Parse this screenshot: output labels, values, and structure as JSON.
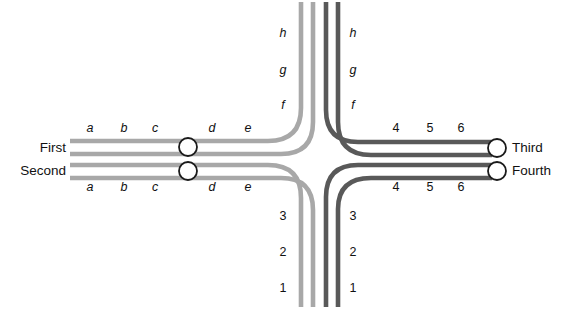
{
  "figure": {
    "type": "track-crossing-diagram",
    "background": "#ffffff",
    "width": 570,
    "height": 309
  },
  "colors": {
    "light_track": "#a8a8a8",
    "dark_track": "#595959",
    "terminal_stroke": "#1a1a1a",
    "terminal_fill": "#ffffff",
    "text": "#111111"
  },
  "terminals": {
    "left": [
      {
        "label": "First",
        "x": 66,
        "y": 148,
        "align": "left"
      },
      {
        "label": "Second",
        "x": 66,
        "y": 171,
        "align": "left"
      }
    ],
    "right": [
      {
        "label": "Third",
        "x": 512,
        "y": 148,
        "align": "right"
      },
      {
        "label": "Fourth",
        "x": 512,
        "y": 171,
        "align": "right"
      }
    ],
    "nodes": [
      {
        "name": "first-node",
        "cx": 188,
        "cy": 147,
        "r": 9
      },
      {
        "name": "second-node",
        "cx": 188,
        "cy": 171,
        "r": 9
      },
      {
        "name": "third-node",
        "cx": 497,
        "cy": 148,
        "r": 9
      },
      {
        "name": "fourth-node",
        "cx": 497,
        "cy": 171,
        "r": 9
      }
    ]
  },
  "segment_labels": {
    "west_top": [
      {
        "t": "a",
        "x": 90,
        "y": 128
      },
      {
        "t": "b",
        "x": 124,
        "y": 128
      },
      {
        "t": "c",
        "x": 155,
        "y": 128
      },
      {
        "t": "d",
        "x": 212,
        "y": 128
      },
      {
        "t": "e",
        "x": 248,
        "y": 128
      }
    ],
    "west_bottom": [
      {
        "t": "a",
        "x": 90,
        "y": 187
      },
      {
        "t": "b",
        "x": 124,
        "y": 187
      },
      {
        "t": "c",
        "x": 155,
        "y": 187
      },
      {
        "t": "d",
        "x": 212,
        "y": 187
      },
      {
        "t": "e",
        "x": 248,
        "y": 187
      }
    ],
    "east_top": [
      {
        "t": "4",
        "x": 396,
        "y": 128
      },
      {
        "t": "5",
        "x": 430,
        "y": 128
      },
      {
        "t": "6",
        "x": 461,
        "y": 128
      }
    ],
    "east_bottom": [
      {
        "t": "4",
        "x": 396,
        "y": 187
      },
      {
        "t": "5",
        "x": 430,
        "y": 187
      },
      {
        "t": "6",
        "x": 461,
        "y": 187
      }
    ],
    "north_left": [
      {
        "t": "h",
        "x": 283,
        "y": 33
      },
      {
        "t": "g",
        "x": 283,
        "y": 70
      },
      {
        "t": "f",
        "x": 283,
        "y": 105
      }
    ],
    "north_right": [
      {
        "t": "h",
        "x": 353,
        "y": 33
      },
      {
        "t": "g",
        "x": 353,
        "y": 70
      },
      {
        "t": "f",
        "x": 353,
        "y": 105
      }
    ],
    "south_left": [
      {
        "t": "3",
        "x": 283,
        "y": 216
      },
      {
        "t": "2",
        "x": 283,
        "y": 252
      },
      {
        "t": "1",
        "x": 283,
        "y": 288
      }
    ],
    "south_right": [
      {
        "t": "3",
        "x": 353,
        "y": 216
      },
      {
        "t": "2",
        "x": 353,
        "y": 252
      },
      {
        "t": "1",
        "x": 353,
        "y": 288
      }
    ]
  },
  "tracks": [
    {
      "name": "track-first-upper",
      "shade": "light",
      "d": "M 70 141 L 268 141 Q 301 141 301 108 L 301 2"
    },
    {
      "name": "track-first-lower",
      "shade": "light",
      "d": "M 70 154 L 281 154 Q 313 154 313 122 L 313 2"
    },
    {
      "name": "track-second-upper",
      "shade": "light",
      "d": "M 70 165 L 268 165 Q 301 165 301 198 L 301 307"
    },
    {
      "name": "track-second-lower",
      "shade": "light",
      "d": "M 70 178 L 281 178 Q 313 178 313 210 L 313 307"
    },
    {
      "name": "track-third-upper",
      "shade": "dark",
      "d": "M 326 2 L 326 110 Q 326 142 358 142 L 492 142"
    },
    {
      "name": "track-third-lower",
      "shade": "dark",
      "d": "M 338 2 L 338 122 Q 338 155 371 155 L 492 155"
    },
    {
      "name": "track-fourth-upper",
      "shade": "dark",
      "d": "M 326 307 L 326 197 Q 326 165 358 165 L 492 165"
    },
    {
      "name": "track-fourth-lower",
      "shade": "dark",
      "d": "M 338 307 L 338 209 Q 338 178 371 178 L 492 178"
    }
  ]
}
